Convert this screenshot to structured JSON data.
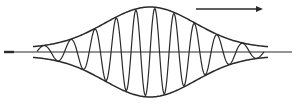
{
  "diagram": {
    "type": "wave-packet",
    "colors": {
      "background": "#ffffff",
      "stroke": "#2a2a2a"
    },
    "axis": {
      "y": 52,
      "x_start": 4,
      "x_end": 292
    },
    "envelope": {
      "center_x": 150,
      "start_x": 33,
      "end_x": 268,
      "peak_half_height": 45,
      "edge_half_height": 4
    },
    "carrier": {
      "half_cycles": 20,
      "description": "sinusoid filling the envelope"
    },
    "direction_arrow": {
      "x1": 196,
      "x2": 263,
      "y": 9,
      "points": "right",
      "meaning": "direction of propagation"
    },
    "labels": []
  }
}
